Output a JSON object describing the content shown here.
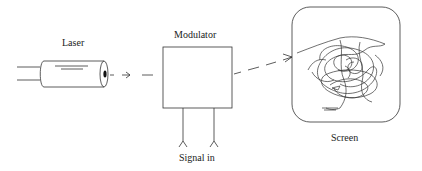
{
  "diagram": {
    "labels": {
      "laser": "Laser",
      "modulator": "Modulator",
      "signal_in": "Signal in",
      "screen": "Screen"
    },
    "colors": {
      "stroke": "#333333",
      "background": "#ffffff"
    }
  }
}
